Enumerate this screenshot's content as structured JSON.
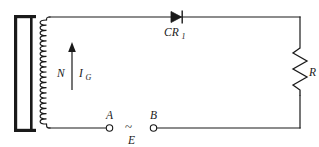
{
  "diagram": {
    "type": "electrical-schematic",
    "background_color": "#ffffff",
    "line_color": "#1a1a1a",
    "canvas": {
      "width": 319,
      "height": 147
    }
  },
  "labels": {
    "winding_turns": "N",
    "gate_current": "I",
    "gate_current_sub": "G",
    "diode": "CR",
    "diode_sub": "1",
    "resistor": "R",
    "terminal_a": "A",
    "terminal_b": "B",
    "source": "E",
    "source_symbol": "~"
  },
  "components": [
    {
      "id": "core",
      "name": "magnetic-core",
      "kind": "transformer-core",
      "label": "",
      "x": 14,
      "y": 15,
      "width": 22,
      "height": 117
    },
    {
      "id": "coil",
      "name": "winding-coil",
      "kind": "inductor-winding",
      "label": "N",
      "turns": 20,
      "x": 40,
      "y": 20,
      "height": 104
    },
    {
      "id": "arrow",
      "name": "gate-current-arrow",
      "kind": "current-direction-arrow",
      "label": "I_G",
      "direction": "up",
      "x": 72,
      "y_top": 44,
      "y_bottom": 90
    },
    {
      "id": "diode",
      "name": "diode-cr1",
      "kind": "diode",
      "label": "CR1",
      "polarity": "anode-left",
      "x": 178,
      "y": 17
    },
    {
      "id": "resistor",
      "name": "load-resistor",
      "kind": "resistor",
      "label": "R",
      "x": 300,
      "y_top": 48,
      "y_bottom": 96
    },
    {
      "id": "terminal-a",
      "name": "terminal-a",
      "kind": "open-terminal",
      "label": "A",
      "x": 110,
      "y": 128
    },
    {
      "id": "terminal-b",
      "name": "terminal-b",
      "kind": "open-terminal",
      "label": "B",
      "x": 152,
      "y": 128
    },
    {
      "id": "source",
      "name": "ac-source-gap",
      "kind": "ac-source",
      "label": "E",
      "symbol": "~",
      "x": 131,
      "y": 128
    }
  ],
  "wires": [
    {
      "name": "top-wire",
      "from": [
        48,
        17
      ],
      "to": [
        300,
        17
      ]
    },
    {
      "name": "right-wire-upper",
      "from": [
        300,
        17
      ],
      "to": [
        300,
        48
      ]
    },
    {
      "name": "right-wire-lower",
      "from": [
        300,
        96
      ],
      "to": [
        300,
        128
      ]
    },
    {
      "name": "bottom-wire-right",
      "from": [
        300,
        128
      ],
      "to": [
        157,
        128
      ]
    },
    {
      "name": "bottom-wire-left",
      "from": [
        48,
        128
      ],
      "to": [
        105,
        128
      ]
    }
  ]
}
